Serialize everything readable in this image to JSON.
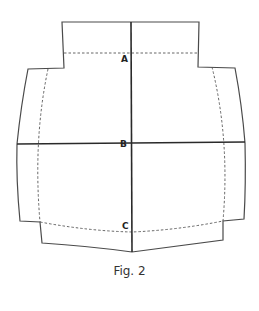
{
  "figure": {
    "caption": "Fig. 2",
    "labels": {
      "a": "A",
      "b": "B",
      "c": "C"
    },
    "colors": {
      "outline": "#4a4a4a",
      "axis": "#2a2a2a",
      "seam": "#555555",
      "background": "#ffffff"
    },
    "elements": {
      "outline": "pattern piece cut line (solid)",
      "seam_lines": "stitching lines (dashed)",
      "vertical_axis": "center line through A, B, C",
      "horizontal_axis": "line through B"
    }
  }
}
